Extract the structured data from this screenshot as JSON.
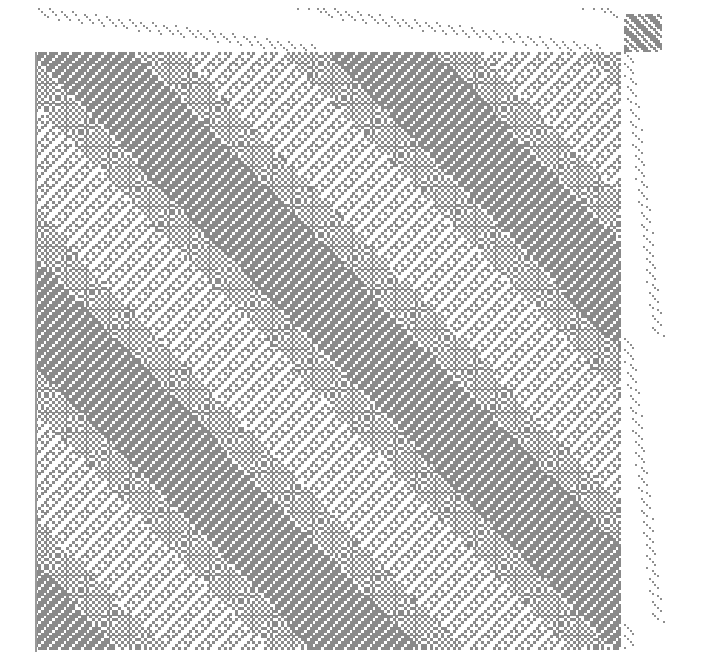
{
  "draft": {
    "title": "Weaving draft",
    "cell_px": 2.86,
    "colors": {
      "background": "#ffffff",
      "warp_up": "#8a8a8a",
      "threading_mark": "#8f8f8f",
      "tieup_mark": "#8a8a8a"
    },
    "threading": {
      "label": "Threading",
      "x": 38,
      "y": 8,
      "width": 584,
      "height": 44,
      "shafts": 16,
      "repeat_ends": 100,
      "style": "descending diagonal runs (broken twill / advancing twill)"
    },
    "tieup": {
      "label": "Tie-up",
      "x": 624,
      "y": 14,
      "width": 38,
      "height": 38,
      "size": 16,
      "style": "twill diagonal stripes"
    },
    "treadling": {
      "label": "Treadling",
      "x": 624,
      "y": 52,
      "width": 44,
      "height": 600,
      "treadles": 16,
      "style": "descending diagonal runs"
    },
    "drawdown": {
      "label": "Drawdown",
      "x": 35,
      "y": 52,
      "width": 587,
      "height": 600,
      "style": "network-drafted twill with wave diagonals",
      "wave_period_px": 300
    }
  }
}
